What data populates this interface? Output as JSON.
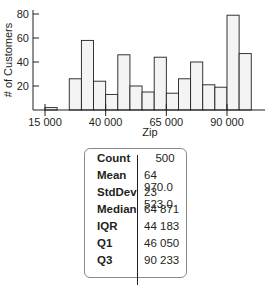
{
  "chart_data": {
    "type": "bar",
    "title": "",
    "xlabel": "Zip",
    "ylabel": "# of Customers",
    "bin_width": 5000,
    "x_ticks": [
      "15 000",
      "40 000",
      "65 000",
      "90 000"
    ],
    "x_tick_values": [
      15000,
      40000,
      65000,
      90000
    ],
    "y_ticks": [
      "20",
      "40",
      "60",
      "80"
    ],
    "y_tick_values": [
      20,
      40,
      60,
      80
    ],
    "ylim": [
      0,
      85
    ],
    "grid": false,
    "bins": [
      {
        "start": 15000,
        "end": 20000,
        "count": 2
      },
      {
        "start": 25000,
        "end": 30000,
        "count": 26
      },
      {
        "start": 30000,
        "end": 35000,
        "count": 58
      },
      {
        "start": 35000,
        "end": 40000,
        "count": 24
      },
      {
        "start": 40000,
        "end": 45000,
        "count": 13
      },
      {
        "start": 45000,
        "end": 50000,
        "count": 46
      },
      {
        "start": 50000,
        "end": 55000,
        "count": 20
      },
      {
        "start": 55000,
        "end": 60000,
        "count": 15
      },
      {
        "start": 60000,
        "end": 65000,
        "count": 44
      },
      {
        "start": 65000,
        "end": 70000,
        "count": 14
      },
      {
        "start": 70000,
        "end": 75000,
        "count": 26
      },
      {
        "start": 75000,
        "end": 80000,
        "count": 40
      },
      {
        "start": 80000,
        "end": 85000,
        "count": 21
      },
      {
        "start": 85000,
        "end": 90000,
        "count": 19
      },
      {
        "start": 90000,
        "end": 95000,
        "count": 79
      },
      {
        "start": 95000,
        "end": 100000,
        "count": 47
      }
    ],
    "colors": {
      "bar_fill": "#f4f4f4",
      "bar_stroke": "#231f20"
    }
  },
  "stats": [
    {
      "label": "Count",
      "value": "500"
    },
    {
      "label": "Mean",
      "value": "64 970.0"
    },
    {
      "label": "StdDev",
      "value": "23 523.0"
    },
    {
      "label": "Median",
      "value": "64 871"
    },
    {
      "label": "IQR",
      "value": "44 183"
    },
    {
      "label": "Q1",
      "value": "46 050"
    },
    {
      "label": "Q3",
      "value": "90 233"
    }
  ]
}
